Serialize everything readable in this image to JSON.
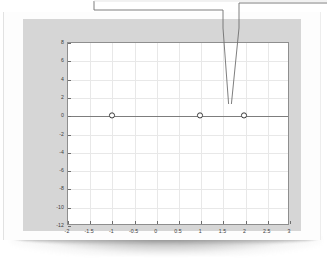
{
  "figure": {
    "background_color": "#d6d6d6",
    "plot_background_color": "#ffffff",
    "curve_color": "#8a8a8a",
    "grid_color": "#e8e8e8",
    "axis_color": "#8e8e8e",
    "marker_label": "root-marker"
  },
  "annotations": {
    "leader_one_name": "callout-leader-left",
    "leader_two_name": "callout-leader-right",
    "target_point": "x = 2"
  },
  "chart_data": {
    "type": "line",
    "title": "",
    "subtitle": "",
    "xlabel": "",
    "ylabel": "",
    "xlim": [
      -2,
      3
    ],
    "ylim": [
      -12,
      8
    ],
    "grid": true,
    "legend": "none",
    "xticks": [
      -2,
      -1.5,
      -1,
      -0.5,
      0,
      0.5,
      1,
      1.5,
      2,
      2.5,
      3
    ],
    "xticklabels": [
      "-2",
      "-1.5",
      "-1",
      "-0.5",
      "0",
      "0.5",
      "1",
      "1.5",
      "2",
      "2.5",
      "3"
    ],
    "yticks": [
      -12,
      -10,
      -8,
      -6,
      -4,
      -2,
      0,
      2,
      4,
      6,
      8
    ],
    "yticklabels": [
      "-12",
      "-10",
      "-8",
      "-6",
      "-4",
      "-2",
      "0",
      "2",
      "4",
      "6",
      "8"
    ],
    "series": [
      {
        "name": "f(x) = (x+1)(x-1)(x-2)^2",
        "x": [
          -2,
          -1.9,
          -1.8,
          -1.7,
          -1.6,
          -1.5,
          -1.4,
          -1.3,
          -1.2,
          -1.1,
          -1,
          -0.9,
          -0.8,
          -0.7,
          -0.6,
          -0.5,
          -0.4,
          -0.3,
          -0.2,
          -0.1,
          0,
          0.1,
          0.2,
          0.3,
          0.4,
          0.5,
          0.6,
          0.7,
          0.8,
          0.9,
          1,
          1.1,
          1.2,
          1.3,
          1.4,
          1.5,
          1.6,
          1.7,
          1.8,
          1.9,
          2,
          2.1,
          2.2,
          2.3,
          2.4,
          2.5,
          2.6,
          2.7,
          2.8,
          2.9,
          3
        ],
        "y": [
          -48,
          -41.1,
          -34.8,
          -29.2,
          -24.2,
          -19.8,
          -15.9,
          -12.5,
          -9.6,
          -7.1,
          -5,
          -3.2,
          -1.8,
          -0.7,
          0.2,
          0.8,
          1.2,
          1.4,
          1.5,
          1.4,
          1.3,
          1.1,
          0.9,
          0.6,
          0.4,
          0.2,
          0.0,
          -0.2,
          -0.3,
          -0.4,
          -0.5,
          -0.6,
          -0.6,
          -0.6,
          -0.6,
          -0.5,
          -0.4,
          -0.3,
          -0.2,
          -0.1,
          0,
          0.2,
          0.5,
          0.9,
          1.5,
          2.3,
          3.3,
          4.6,
          6.3,
          8.4,
          11
        ]
      }
    ],
    "markers": [
      {
        "x": -1,
        "y": 0,
        "label": "-1"
      },
      {
        "x": 1,
        "y": 0,
        "label": "1"
      },
      {
        "x": 2,
        "y": 0,
        "label": "2"
      }
    ]
  }
}
